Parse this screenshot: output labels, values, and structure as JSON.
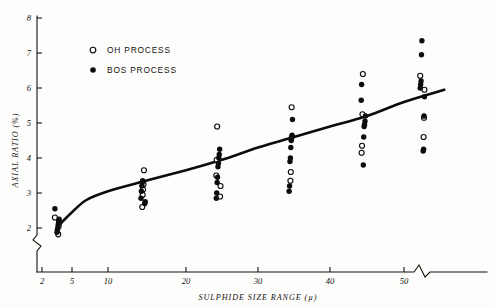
{
  "chart_data": {
    "type": "scatter",
    "title": "",
    "xlabel": "SULPHIDE SIZE RANGE (µ)",
    "ylabel": "AXIAL RATIO (%)",
    "xlim": [
      2,
      56
    ],
    "ylim": [
      1.6,
      8
    ],
    "grid": false,
    "x_ticks": [
      2,
      5,
      10,
      20,
      30,
      40,
      50
    ],
    "x_tick_labels": [
      "2",
      "5",
      "10",
      "20",
      "30",
      "40",
      "50"
    ],
    "y_ticks": [
      2,
      3,
      4,
      5,
      6,
      7,
      8
    ],
    "y_tick_labels": [
      "2",
      "3",
      "4",
      "5",
      "6",
      "7",
      "8"
    ],
    "x_axis_break": true,
    "y_axis_break": true,
    "legend_position": "upper-left",
    "series": [
      {
        "name": "OH PROCESS",
        "marker": "open-circle",
        "color": "#0d0c0a",
        "points": [
          {
            "x": 3.5,
            "y": 2.3
          },
          {
            "x": 3.5,
            "y": 2.15
          },
          {
            "x": 3.5,
            "y": 2.05
          },
          {
            "x": 3.5,
            "y": 1.82
          },
          {
            "x": 14.5,
            "y": 3.65
          },
          {
            "x": 14.5,
            "y": 3.25
          },
          {
            "x": 14.5,
            "y": 3.1
          },
          {
            "x": 14.5,
            "y": 2.95
          },
          {
            "x": 14.5,
            "y": 2.6
          },
          {
            "x": 24.5,
            "y": 4.9
          },
          {
            "x": 24.5,
            "y": 3.95
          },
          {
            "x": 24.5,
            "y": 3.5
          },
          {
            "x": 24.5,
            "y": 3.2
          },
          {
            "x": 24.5,
            "y": 2.9
          },
          {
            "x": 34.5,
            "y": 5.45
          },
          {
            "x": 34.5,
            "y": 4.55
          },
          {
            "x": 34.5,
            "y": 3.6
          },
          {
            "x": 34.5,
            "y": 3.35
          },
          {
            "x": 44.5,
            "y": 6.4
          },
          {
            "x": 44.5,
            "y": 5.25
          },
          {
            "x": 44.5,
            "y": 4.35
          },
          {
            "x": 44.5,
            "y": 4.15
          },
          {
            "x": 52.5,
            "y": 6.35
          },
          {
            "x": 52.5,
            "y": 5.95
          },
          {
            "x": 52.5,
            "y": 5.15
          },
          {
            "x": 52.5,
            "y": 4.6
          }
        ]
      },
      {
        "name": "BOS PROCESS",
        "marker": "filled-circle",
        "color": "#0d0c0a",
        "points": [
          {
            "x": 3.5,
            "y": 2.55
          },
          {
            "x": 3.5,
            "y": 2.25
          },
          {
            "x": 3.5,
            "y": 2.2
          },
          {
            "x": 3.5,
            "y": 2.1
          },
          {
            "x": 3.5,
            "y": 2.0
          },
          {
            "x": 3.5,
            "y": 1.95
          },
          {
            "x": 3.5,
            "y": 1.88
          },
          {
            "x": 14.5,
            "y": 3.35
          },
          {
            "x": 14.5,
            "y": 3.3
          },
          {
            "x": 14.5,
            "y": 3.2
          },
          {
            "x": 14.5,
            "y": 3.05
          },
          {
            "x": 14.5,
            "y": 2.85
          },
          {
            "x": 14.5,
            "y": 2.75
          },
          {
            "x": 14.5,
            "y": 2.7
          },
          {
            "x": 24.5,
            "y": 4.25
          },
          {
            "x": 24.5,
            "y": 4.1
          },
          {
            "x": 24.5,
            "y": 4.0
          },
          {
            "x": 24.5,
            "y": 3.85
          },
          {
            "x": 24.5,
            "y": 3.75
          },
          {
            "x": 24.5,
            "y": 3.45
          },
          {
            "x": 24.5,
            "y": 3.3
          },
          {
            "x": 24.5,
            "y": 3.0
          },
          {
            "x": 24.5,
            "y": 2.85
          },
          {
            "x": 34.5,
            "y": 5.1
          },
          {
            "x": 34.5,
            "y": 4.65
          },
          {
            "x": 34.5,
            "y": 4.6
          },
          {
            "x": 34.5,
            "y": 4.5
          },
          {
            "x": 34.5,
            "y": 4.3
          },
          {
            "x": 34.5,
            "y": 4.0
          },
          {
            "x": 34.5,
            "y": 3.9
          },
          {
            "x": 34.5,
            "y": 3.2
          },
          {
            "x": 34.5,
            "y": 3.05
          },
          {
            "x": 44.5,
            "y": 6.1
          },
          {
            "x": 44.5,
            "y": 5.65
          },
          {
            "x": 44.5,
            "y": 5.2
          },
          {
            "x": 44.5,
            "y": 5.05
          },
          {
            "x": 44.5,
            "y": 4.95
          },
          {
            "x": 44.5,
            "y": 4.9
          },
          {
            "x": 44.5,
            "y": 4.6
          },
          {
            "x": 44.5,
            "y": 3.8
          },
          {
            "x": 52.5,
            "y": 7.35
          },
          {
            "x": 52.5,
            "y": 6.95
          },
          {
            "x": 52.5,
            "y": 6.2
          },
          {
            "x": 52.5,
            "y": 6.1
          },
          {
            "x": 52.5,
            "y": 6.0
          },
          {
            "x": 52.5,
            "y": 5.75
          },
          {
            "x": 52.5,
            "y": 5.2
          },
          {
            "x": 52.5,
            "y": 4.25
          },
          {
            "x": 52.5,
            "y": 4.2
          }
        ]
      }
    ],
    "fit_curve": {
      "name": "trend-line",
      "points": [
        {
          "x": 3.6,
          "y": 2.05
        },
        {
          "x": 5.0,
          "y": 2.45
        },
        {
          "x": 7.0,
          "y": 2.8
        },
        {
          "x": 10.0,
          "y": 3.05
        },
        {
          "x": 14.0,
          "y": 3.3
        },
        {
          "x": 20.0,
          "y": 3.65
        },
        {
          "x": 25.0,
          "y": 3.95
        },
        {
          "x": 30.0,
          "y": 4.3
        },
        {
          "x": 35.0,
          "y": 4.6
        },
        {
          "x": 40.0,
          "y": 4.9
        },
        {
          "x": 45.0,
          "y": 5.2
        },
        {
          "x": 50.0,
          "y": 5.6
        },
        {
          "x": 55.5,
          "y": 5.95
        }
      ]
    }
  },
  "legend": {
    "entries": [
      {
        "label": "OH PROCESS",
        "marker": "open-circle"
      },
      {
        "label": "BOS PROCESS",
        "marker": "filled-circle"
      }
    ]
  },
  "axes": {
    "x_title": "SULPHIDE SIZE RANGE (µ)",
    "y_title": "AXIAL RATIO (%)"
  }
}
